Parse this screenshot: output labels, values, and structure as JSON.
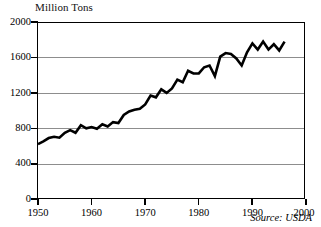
{
  "chart_data": {
    "type": "line",
    "title": "Million Tons",
    "xlabel": "",
    "ylabel": "Million Tons",
    "ylim": [
      0,
      2000
    ],
    "xlim": [
      1950,
      2000
    ],
    "grid": true,
    "gridlines_y": [
      400,
      800,
      1200,
      1600
    ],
    "legend": "none",
    "yticks": [
      0,
      400,
      800,
      1200,
      1600,
      2000
    ],
    "ytick_labels": [
      "0",
      "400",
      "800",
      "1200",
      "1600",
      "2000"
    ],
    "xticks": [
      1950,
      1960,
      1970,
      1980,
      1990,
      2000
    ],
    "xtick_labels": [
      "1950",
      "1960",
      "1970",
      "1980",
      "1990",
      "2000"
    ],
    "annotations": [
      {
        "name": "source",
        "text": "Source: USDA",
        "position": "bottom-right",
        "style": "italic"
      }
    ],
    "series": [
      {
        "name": "World Grain Production",
        "color": "#000000",
        "x": [
          1950,
          1951,
          1952,
          1953,
          1954,
          1955,
          1956,
          1957,
          1958,
          1959,
          1960,
          1961,
          1962,
          1963,
          1964,
          1965,
          1966,
          1967,
          1968,
          1969,
          1970,
          1971,
          1972,
          1973,
          1974,
          1975,
          1976,
          1977,
          1978,
          1979,
          1980,
          1981,
          1982,
          1983,
          1984,
          1985,
          1986,
          1987,
          1988,
          1989,
          1990,
          1991,
          1992,
          1993,
          1994,
          1995,
          1996
        ],
        "values": [
          631,
          662,
          700,
          715,
          704,
          760,
          790,
          760,
          845,
          810,
          825,
          805,
          855,
          830,
          880,
          870,
          960,
          1000,
          1020,
          1030,
          1080,
          1180,
          1160,
          1250,
          1210,
          1260,
          1360,
          1330,
          1460,
          1430,
          1430,
          1500,
          1520,
          1400,
          1620,
          1660,
          1650,
          1600,
          1520,
          1670,
          1770,
          1700,
          1790,
          1700,
          1760,
          1690,
          1790
        ]
      }
    ]
  },
  "axes": {
    "y_labels": [
      "2000",
      "1600",
      "1200",
      "800",
      "400",
      "0"
    ],
    "x_labels": [
      "1950",
      "1960",
      "1970",
      "1980",
      "1990",
      "2000"
    ]
  },
  "source_note": "Source: USDA"
}
